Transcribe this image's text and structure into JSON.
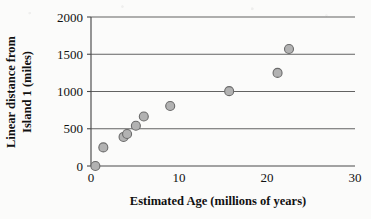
{
  "chart_data": {
    "type": "scatter",
    "title": "",
    "xlabel": "Estimated Age (millions of years)",
    "ylabel": "Linear distance from Island 1 (miles)",
    "ylabel_line1": "Linear distance from",
    "ylabel_line2": "Island 1 (miles)",
    "xlim": [
      0,
      30
    ],
    "ylim": [
      0,
      2000
    ],
    "xticks": [
      0,
      10,
      20,
      30
    ],
    "xtick_labels": [
      "0",
      "10",
      "20",
      "30"
    ],
    "yticks": [
      0,
      500,
      1000,
      1500,
      2000
    ],
    "ytick_labels": [
      "0",
      "500",
      "1000",
      "1500",
      "2000"
    ],
    "grid": "horizontal",
    "legend": "none",
    "marker_color": "#b2b2b2",
    "marker_edge_color": "#6a6a6a",
    "marker_size_px": 9,
    "points": [
      {
        "x": 0.5,
        "y": 0
      },
      {
        "x": 1.4,
        "y": 250
      },
      {
        "x": 3.7,
        "y": 390
      },
      {
        "x": 4.1,
        "y": 430
      },
      {
        "x": 5.1,
        "y": 540
      },
      {
        "x": 6.0,
        "y": 665
      },
      {
        "x": 9.0,
        "y": 805
      },
      {
        "x": 15.7,
        "y": 1005
      },
      {
        "x": 21.2,
        "y": 1250
      },
      {
        "x": 22.5,
        "y": 1570
      }
    ]
  },
  "axes": {
    "y_axis_name": "y-axis",
    "x_axis_name": "x-axis"
  }
}
